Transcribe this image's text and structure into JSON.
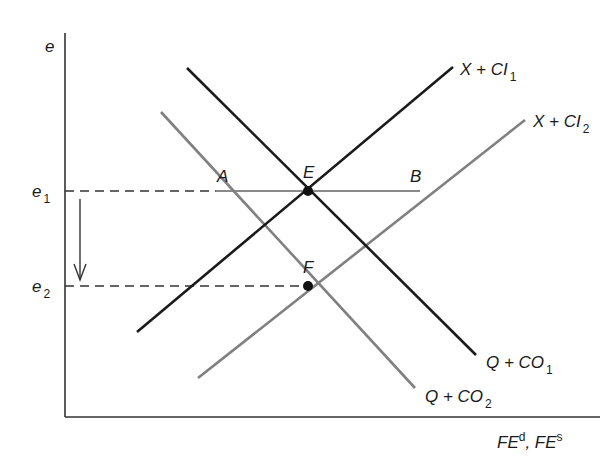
{
  "diagram": {
    "axes": {
      "y_label": "e",
      "x_label_parts": [
        "FE",
        "d",
        ", FE",
        "s"
      ]
    },
    "levels": {
      "e1": {
        "base": "e",
        "sub": "1"
      },
      "e2": {
        "base": "e",
        "sub": "2"
      }
    },
    "curves": {
      "supply1": {
        "base": "X + CI",
        "sub": "1",
        "color": "#1a1a1a"
      },
      "supply2": {
        "base": "X + CI",
        "sub": "2",
        "color": "#808080"
      },
      "demand1": {
        "base": "Q + CO",
        "sub": "1",
        "color": "#1a1a1a"
      },
      "demand2": {
        "base": "Q + CO",
        "sub": "2",
        "color": "#808080"
      }
    },
    "points": {
      "A": "A",
      "B": "B",
      "E": "E",
      "F": "F"
    },
    "annotation": {
      "arrow": "down"
    }
  }
}
